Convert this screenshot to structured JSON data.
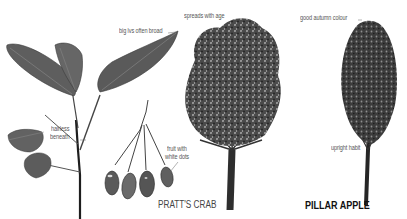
{
  "illustration": {
    "subject": "Crab apple trees comparison",
    "colors": {
      "ink": "#2b2b2b",
      "leaf": "#5a5a5a",
      "label": "#555555",
      "background": "#ffffff"
    },
    "species": [
      {
        "name": "PRATT'S CRAB",
        "style": "light",
        "annotations": [
          {
            "text": "big lvs often broad",
            "target": "leaf"
          },
          {
            "text": "spreads with age",
            "target": "tree-crown"
          },
          {
            "text_line1": "hairless",
            "text_line2": "beneath",
            "target": "leaf-underside"
          },
          {
            "text_line1": "fruit with",
            "text_line2": "white dots",
            "target": "fruit"
          }
        ]
      },
      {
        "name": "PILLAR APPLE",
        "style": "bold",
        "annotations": [
          {
            "text": "good autumn colour",
            "target": "tree-crown"
          },
          {
            "text": "upright habit",
            "target": "trunk"
          }
        ]
      }
    ]
  }
}
